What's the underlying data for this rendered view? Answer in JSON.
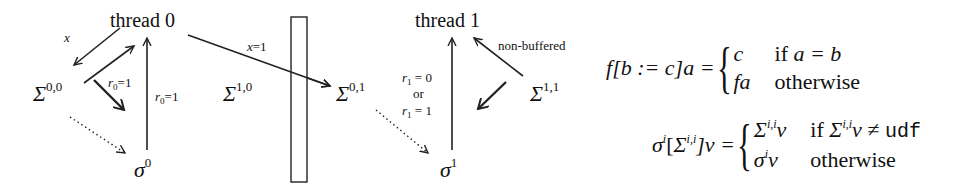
{
  "diagram": {
    "nodes": {
      "thread0": "thread 0",
      "thread1": "thread 1",
      "sigma00": {
        "base": "Σ",
        "sup": "0,0"
      },
      "sigma10": {
        "base": "Σ",
        "sup": "1,0"
      },
      "sigma01": {
        "base": "Σ",
        "sup": "0,1"
      },
      "sigma11": {
        "base": "Σ",
        "sup": "1,1"
      },
      "mem0": {
        "base": "σ",
        "sup": "0"
      },
      "mem1": {
        "base": "σ",
        "sup": "1"
      }
    },
    "edge_labels": {
      "t0_to_s00": "x=1",
      "t0_to_s01": "x=1",
      "s00_to_t0": "r",
      "s00_to_t0_sub": "0",
      "s00_to_t0_val": "=1",
      "mem0_to_t0": "r",
      "mem0_to_t0_sub": "0",
      "mem0_to_t0_val": "=1",
      "t1_read_a": "r",
      "t1_read_a_sub": "1",
      "t1_read_a_val": " = 0",
      "t1_read_or": "or",
      "t1_read_b": "r",
      "t1_read_b_sub": "1",
      "t1_read_b_val": " = 1",
      "s11_to_t1": "non-buffered"
    }
  },
  "formulas": {
    "update": {
      "lhs_f": "f",
      "lhs_rest": "[b := c]a =",
      "case1_value": "c",
      "case1_cond_if": "if ",
      "case1_cond": "a = b",
      "case2_value": "fa",
      "case2_cond": "otherwise"
    },
    "merge": {
      "lhs_sigma": "σ",
      "lhs_sigma_sup": "i",
      "lhs_open": "[",
      "lhs_Sigma": "Σ",
      "lhs_Sigma_sup": "i,i",
      "lhs_close": "]v =",
      "case1_Sigma": "Σ",
      "case1_Sigma_sup": "i,i",
      "case1_v": "v",
      "case1_cond_if": "if ",
      "case1_cond_Sigma": "Σ",
      "case1_cond_Sigma_sup": "i,i",
      "case1_cond_rest": "v ≠ ",
      "case1_cond_udf": "udf",
      "case2_sigma": "σ",
      "case2_sigma_sup": "i",
      "case2_v": "v",
      "case2_cond": "otherwise"
    }
  }
}
